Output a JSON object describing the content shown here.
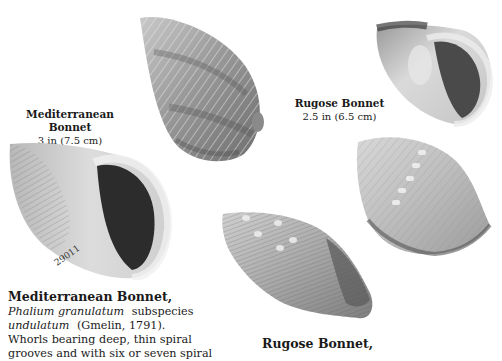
{
  "page": {
    "background": "#ffffff"
  },
  "captions": {
    "mediterranean": {
      "name": "Mediterranean Bonnet",
      "size": "3 in (7.5 cm)"
    },
    "rugose": {
      "name": "Rugose Bonnet",
      "size": "2.5 in (6.5 cm)"
    }
  },
  "specimen_label": "29011",
  "entries": {
    "mediterranean": {
      "title": "Mediterranean Bonnet,",
      "genus_species": "Phalium granulatum",
      "subspecies_word": "subspecies",
      "subspecies": "undulatum",
      "authority": "(Gmelin, 1791).",
      "desc_line1": "Whorls bearing deep, thin spiral",
      "desc_line2": "grooves and with six or seven spiral"
    },
    "rugose": {
      "title": "Rugose Bonnet,"
    }
  },
  "images": [
    {
      "id": "mediterranean-dorsal",
      "description": "Mediterranean Bonnet shell, dorsal view"
    },
    {
      "id": "mediterranean-aperture",
      "description": "Mediterranean Bonnet shell, aperture view"
    },
    {
      "id": "rugose-aperture",
      "description": "Rugose Bonnet shell, aperture view"
    },
    {
      "id": "rugose-dorsal",
      "description": "Rugose Bonnet shell, dorsal view"
    },
    {
      "id": "rugose-side",
      "description": "Rugose Bonnet shell, side view"
    }
  ]
}
